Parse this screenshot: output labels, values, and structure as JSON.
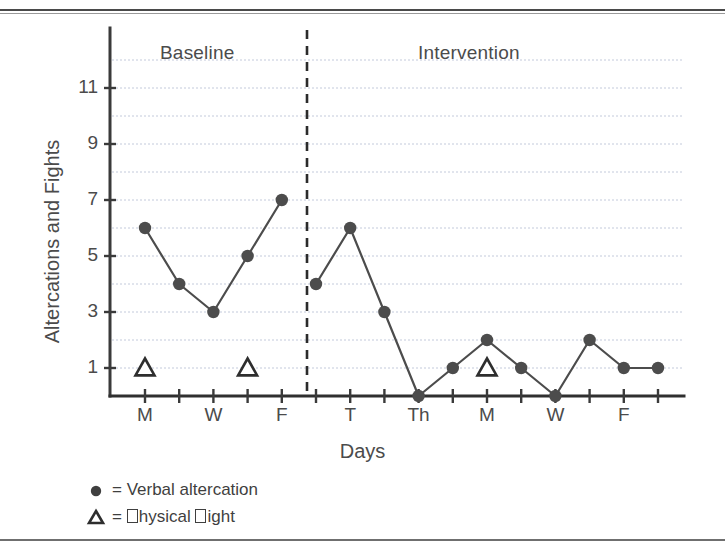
{
  "figure": {
    "phases": [
      {
        "key": "baseline",
        "label": "Baseline"
      },
      {
        "key": "intervention",
        "label": "Intervention"
      }
    ],
    "legend": [
      {
        "glyph": "filled-circle",
        "text": "= Verbal altercation"
      },
      {
        "glyph": "open-triangle",
        "text": "= □hysical □ight"
      }
    ]
  },
  "chart_data": {
    "type": "line",
    "title": "",
    "xlabel": "Days",
    "ylabel": "Altercations and Fights",
    "ylim": [
      0,
      12
    ],
    "yticks": [
      1,
      3,
      5,
      7,
      9,
      11
    ],
    "ytick_labels": [
      "1",
      "3",
      "5",
      "7",
      "9",
      "11"
    ],
    "grid": true,
    "grid_values": [
      1,
      2,
      3,
      4,
      5,
      6,
      7,
      8,
      9,
      10,
      11,
      12
    ],
    "legend_position": "below-axes-left",
    "x": [
      1,
      2,
      3,
      4,
      5,
      6,
      7,
      8,
      9,
      10,
      11,
      12,
      13,
      14,
      15,
      16
    ],
    "xtick_labels": [
      "M",
      "",
      "W",
      "",
      "F",
      "",
      "T",
      "",
      "Th",
      "",
      "M",
      "",
      "W",
      "",
      "F",
      ""
    ],
    "phase_break_after_x": 5,
    "phase_line_style": "dashed",
    "series": [
      {
        "name": "Verbal altercation",
        "marker": "filled-circle",
        "color": "#4c4c4c",
        "phases": [
          {
            "name": "Baseline",
            "x": [
              1,
              2,
              3,
              4,
              5
            ],
            "values": [
              6,
              4,
              3,
              5,
              7
            ]
          },
          {
            "name": "Intervention",
            "x": [
              6,
              7,
              8,
              9,
              10,
              11,
              12,
              13,
              14,
              15,
              16
            ],
            "values": [
              4,
              6,
              3,
              0,
              1,
              2,
              1,
              0,
              2,
              1,
              1
            ]
          }
        ]
      },
      {
        "name": "□hysical □ight",
        "marker": "open-triangle",
        "color": "#2e2e2e",
        "points": [
          {
            "x": 1,
            "value": 1,
            "phase": "Baseline"
          },
          {
            "x": 4,
            "value": 1,
            "phase": "Baseline"
          },
          {
            "x": 11,
            "value": 1,
            "phase": "Intervention"
          }
        ]
      }
    ]
  },
  "colors": {
    "axis": "#3a3a3a",
    "grid": "#b9c2d6",
    "marker": "#4c4c4c",
    "line": "#4c4c4c",
    "text": "#4b4b4b",
    "phase_line": "#2b2b2b",
    "rule": "#4a4a4a"
  }
}
